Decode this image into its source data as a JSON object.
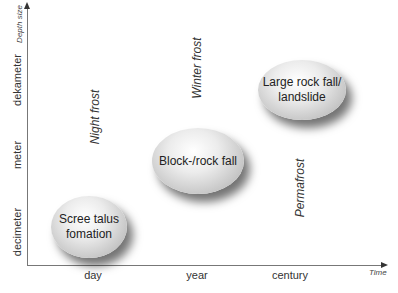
{
  "axes": {
    "y_title": "Depth size",
    "x_title": "Time",
    "y_labels": [
      "decimeter",
      "meter",
      "dekameter"
    ],
    "x_labels": [
      "day",
      "year",
      "century"
    ]
  },
  "frost_labels": {
    "night": "Night frost",
    "winter": "Winter frost",
    "permafrost": "Permafrost"
  },
  "processes": [
    {
      "label": "Scree talus fomation",
      "line1": "Scree talus",
      "line2": "fomation",
      "time": "day",
      "size": "decimeter"
    },
    {
      "label": "Block-/rock fall",
      "line1": "Block-/rock fall",
      "line2": "",
      "time": "year",
      "size": "meter"
    },
    {
      "label": "Large rock fall/ landslide",
      "line1": "Large rock fall/",
      "line2": "landslide",
      "time": "century",
      "size": "dekameter"
    }
  ],
  "colors": {
    "axis": "#777777",
    "bubble_light": "#ffffff",
    "bubble_dark": "#a8a8a8",
    "text": "#2a2a2a"
  }
}
